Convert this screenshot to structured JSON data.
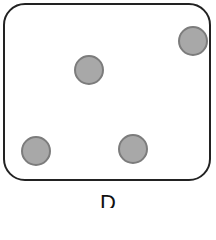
{
  "figure": {
    "label": "D",
    "dot_count": 4,
    "dots": [
      {
        "cx": 89,
        "cy": 70
      },
      {
        "cx": 193,
        "cy": 41
      },
      {
        "cx": 36,
        "cy": 151
      },
      {
        "cx": 133,
        "cy": 149
      }
    ],
    "colors": {
      "dot_fill": "#a8a8a8",
      "dot_stroke": "#7c7c7c",
      "frame": "#222222"
    }
  }
}
